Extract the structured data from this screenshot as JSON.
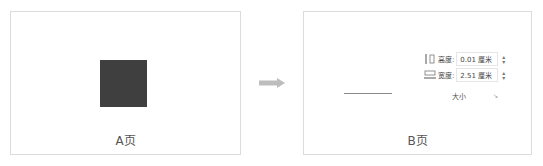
{
  "pageA": {
    "caption": "A页",
    "shape_color": "#3f3f3f"
  },
  "arrow": {
    "color": "#bdbdbd"
  },
  "pageB": {
    "caption": "B页",
    "height_row": {
      "label": "高度:",
      "value": "0.01 厘米"
    },
    "width_row": {
      "label": "宽度:",
      "value": "2.51 厘米"
    },
    "group_label": "大小",
    "launcher_glyph": "↘"
  }
}
